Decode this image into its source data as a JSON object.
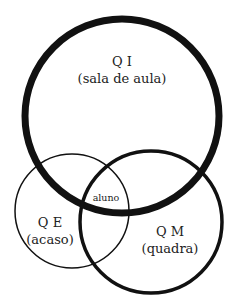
{
  "diagram": {
    "type": "venn",
    "sets": [
      {
        "id": "qi",
        "title": "Q I",
        "subtitle": "(sala de aula)",
        "cx": 122,
        "cy": 116,
        "r": 97,
        "stroke_width": 7
      },
      {
        "id": "qe",
        "title": "Q E",
        "subtitle": "(acaso)",
        "cx": 72,
        "cy": 211,
        "r": 57,
        "stroke_width": 1.5
      },
      {
        "id": "qm",
        "title": "Q M",
        "subtitle": "(quadra)",
        "cx": 151,
        "cy": 222,
        "r": 71,
        "stroke_width": 3.5
      }
    ],
    "intersection_label": "aluno",
    "stroke_color": "#111111",
    "background": "#ffffff"
  }
}
